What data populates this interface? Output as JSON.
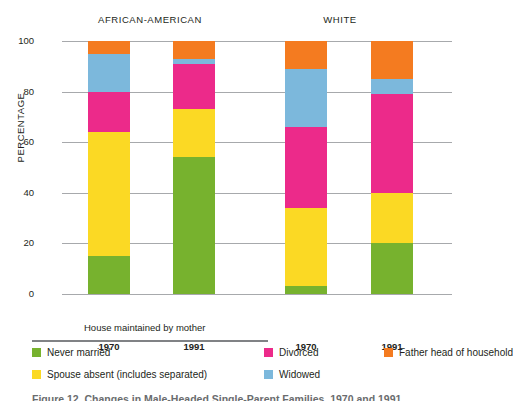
{
  "chart_data": {
    "type": "bar",
    "subtype": "stacked-bar-100",
    "title": "",
    "xlabel": "House maintained by mother",
    "ylabel": "PERCENTAGE",
    "ylim": [
      0,
      100
    ],
    "yticks": [
      "0",
      "20",
      "40",
      "60",
      "80",
      "100"
    ],
    "grid": true,
    "legend_position": "bottom",
    "group_labels": [
      "AFRICAN-AMERICAN",
      "WHITE"
    ],
    "categories": [
      "1970",
      "1991",
      "1970",
      "1991"
    ],
    "bars": [
      {
        "group": "AFRICAN-AMERICAN",
        "year": "1970",
        "segments": [
          {
            "name": "Never married",
            "value": 15
          },
          {
            "name": "Spouse absent (includes separated)",
            "value": 49
          },
          {
            "name": "Divorced",
            "value": 16
          },
          {
            "name": "Widowed",
            "value": 15
          },
          {
            "name": "Father head of household",
            "value": 5
          }
        ]
      },
      {
        "group": "AFRICAN-AMERICAN",
        "year": "1991",
        "segments": [
          {
            "name": "Never married",
            "value": 54
          },
          {
            "name": "Spouse absent (includes separated)",
            "value": 19
          },
          {
            "name": "Divorced",
            "value": 18
          },
          {
            "name": "Widowed",
            "value": 2
          },
          {
            "name": "Father head of household",
            "value": 7
          }
        ]
      },
      {
        "group": "WHITE",
        "year": "1970",
        "segments": [
          {
            "name": "Never married",
            "value": 3
          },
          {
            "name": "Spouse absent (includes separated)",
            "value": 31
          },
          {
            "name": "Divorced",
            "value": 32
          },
          {
            "name": "Widowed",
            "value": 23
          },
          {
            "name": "Father head of household",
            "value": 11
          }
        ]
      },
      {
        "group": "WHITE",
        "year": "1991",
        "segments": [
          {
            "name": "Never married",
            "value": 20
          },
          {
            "name": "Spouse absent (includes separated)",
            "value": 20
          },
          {
            "name": "Divorced",
            "value": 39
          },
          {
            "name": "Widowed",
            "value": 6
          },
          {
            "name": "Father head of household",
            "value": 15
          }
        ]
      }
    ],
    "series": [
      {
        "name": "Never married",
        "color": "#77B22E",
        "values": [
          15,
          54,
          3,
          20
        ]
      },
      {
        "name": "Spouse absent (includes separated)",
        "color": "#FBD924",
        "values": [
          49,
          19,
          31,
          20
        ]
      },
      {
        "name": "Divorced",
        "color": "#EC2A8A",
        "values": [
          16,
          18,
          32,
          39
        ]
      },
      {
        "name": "Widowed",
        "color": "#7CB8DC",
        "values": [
          15,
          2,
          23,
          6
        ]
      },
      {
        "name": "Father head of household",
        "color": "#F47B20",
        "values": [
          5,
          7,
          11,
          15
        ]
      }
    ]
  },
  "axis": {
    "ylabel": "PERCENTAGE",
    "yticks": [
      "100",
      "80",
      "60",
      "40",
      "20",
      "0"
    ],
    "xticks": [
      "1970",
      "1991",
      "1970",
      "1991"
    ]
  },
  "groups": {
    "left": "AFRICAN-AMERICAN",
    "right": "WHITE"
  },
  "notes": {
    "house_maintained": "House maintained by mother"
  },
  "legend": {
    "items": [
      {
        "label": "Never married",
        "color": "#77B22E"
      },
      {
        "label": "Divorced",
        "color": "#EC2A8A"
      },
      {
        "label": "Father head of household",
        "color": "#F47B20"
      },
      {
        "label": "Spouse absent (includes separated)",
        "color": "#FBD924"
      },
      {
        "label": "Widowed",
        "color": "#7CB8DC"
      }
    ]
  },
  "caption": {
    "text": "Figure 12. Changes in Male-Headed Single-Parent Families, 1970 and 1991"
  },
  "colors": {
    "never_married": "#77B22E",
    "spouse_absent": "#FBD924",
    "divorced": "#EC2A8A",
    "widowed": "#7CB8DC",
    "father_head": "#F47B20",
    "gridline": "#a7a9ac",
    "text": "#231f20"
  }
}
